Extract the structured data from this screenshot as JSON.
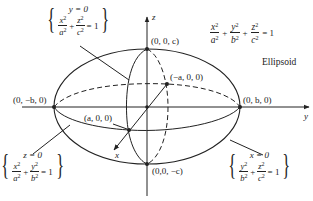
{
  "figure": {
    "title": "Ellipsoid",
    "equation": {
      "terms": [
        {
          "num": "x",
          "den": "a"
        },
        {
          "num": "y",
          "den": "b"
        },
        {
          "num": "z",
          "den": "c"
        }
      ],
      "exponent": "2",
      "plus": "+",
      "equals": "= 1"
    },
    "axes": {
      "x": "x",
      "y": "y",
      "z": "z"
    },
    "points": {
      "top": "(0, 0, c)",
      "bottom": "(0,0, −c)",
      "left": "(0, −b, 0)",
      "right": "(0, b, 0)",
      "front": "(a, 0, 0)",
      "back": "(−a, 0, 0)"
    },
    "traces": [
      {
        "id": "xz-trace",
        "condition": "y = 0",
        "terms": [
          {
            "num": "x",
            "den": "a"
          },
          {
            "num": "z",
            "den": "c"
          }
        ],
        "rhs": "= 1"
      },
      {
        "id": "xy-trace",
        "condition": "z = 0",
        "terms": [
          {
            "num": "x",
            "den": "a"
          },
          {
            "num": "y",
            "den": "b"
          }
        ],
        "rhs": "= 1"
      },
      {
        "id": "yz-trace",
        "condition": "x = 0",
        "terms": [
          {
            "num": "y",
            "den": "b"
          },
          {
            "num": "z",
            "den": "c"
          }
        ],
        "rhs": "= 1"
      }
    ],
    "ink_color": "#222222"
  }
}
